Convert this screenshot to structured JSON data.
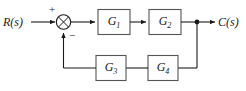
{
  "diagram": {
    "type": "control-system-block-diagram",
    "colors": {
      "line": "#1a1a1a",
      "block_fill": "#ffffff",
      "block_stroke": "#555555",
      "background": "#ffffff",
      "text": "#1a1a1a"
    },
    "signals": {
      "input_label": "R(s)",
      "output_label": "C(s)"
    },
    "summing_junction": {
      "name": "summing-junction",
      "positive_sign": "+",
      "negative_sign": "−"
    },
    "blocks": [
      {
        "id": "G1",
        "base": "G",
        "subscript": "1",
        "path": "forward"
      },
      {
        "id": "G2",
        "base": "G",
        "subscript": "2",
        "path": "forward"
      },
      {
        "id": "G3",
        "base": "G",
        "subscript": "3",
        "path": "feedback"
      },
      {
        "id": "G4",
        "base": "G",
        "subscript": "4",
        "path": "feedback"
      }
    ],
    "nodes": [
      {
        "id": "pickoff",
        "name": "output-pickoff-node"
      }
    ]
  }
}
